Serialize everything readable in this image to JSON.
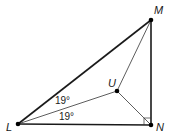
{
  "diagram": {
    "type": "geometry",
    "points": [
      {
        "id": "M",
        "label": "M",
        "x": 151,
        "y": 20,
        "lx": 154,
        "ly": 14
      },
      {
        "id": "L",
        "label": "L",
        "x": 18,
        "y": 124,
        "lx": 6,
        "ly": 131
      },
      {
        "id": "N",
        "label": "N",
        "x": 151,
        "y": 125,
        "lx": 156,
        "ly": 131
      },
      {
        "id": "U",
        "label": "U",
        "x": 117,
        "y": 91,
        "lx": 108,
        "ly": 87
      }
    ],
    "segments": [
      {
        "from": "L",
        "to": "M",
        "weight": "thick"
      },
      {
        "from": "L",
        "to": "N",
        "weight": "thick"
      },
      {
        "from": "M",
        "to": "N",
        "weight": "thick"
      },
      {
        "from": "L",
        "to": "U",
        "weight": "thin"
      },
      {
        "from": "M",
        "to": "U",
        "weight": "thin"
      },
      {
        "from": "N",
        "to": "U",
        "weight": "thin"
      }
    ],
    "angle_labels": [
      {
        "text": "19°",
        "x": 55,
        "y": 104,
        "between": "LM-LU"
      },
      {
        "text": "19°",
        "x": 59,
        "y": 120,
        "between": "LU-LN"
      }
    ],
    "right_angle": {
      "at": "N",
      "between": "NM-NL",
      "size": 7
    },
    "colors": {
      "line": "#1a1a1a",
      "point": "#000000",
      "background": "#ffffff"
    }
  }
}
